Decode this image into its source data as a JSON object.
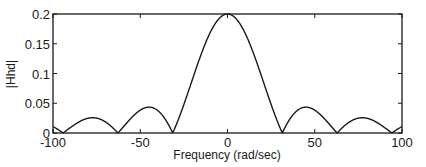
{
  "chart_data": {
    "type": "line",
    "title": "",
    "xlabel": "Frequency (rad/sec)",
    "ylabel": "|Hhd|",
    "xlim": [
      -100,
      100
    ],
    "ylim": [
      0,
      0.2
    ],
    "xticks": [
      -100,
      -50,
      0,
      50,
      100
    ],
    "xtick_labels": [
      "-100",
      "-50",
      "0",
      "50",
      "100"
    ],
    "yticks": [
      0,
      0.05,
      0.1,
      0.15,
      0.2
    ],
    "ytick_labels": [
      "0",
      "0.05",
      "0.1",
      "0.15",
      "0.2"
    ],
    "grid": false,
    "legend": null,
    "series": [
      {
        "name": "|Hhd|",
        "description": "magnitude response, approx 0.2*|sin(0.1w)/(0.1w)|",
        "x": [
          -100,
          -94.2,
          -77.3,
          -62.8,
          -45.0,
          -31.4,
          -20,
          -10,
          0,
          10,
          20,
          31.4,
          45.0,
          62.8,
          77.3,
          94.2,
          100
        ],
        "values": [
          0.011,
          0.0,
          0.026,
          0.0,
          0.043,
          0.0,
          0.091,
          0.168,
          0.2,
          0.168,
          0.091,
          0.0,
          0.043,
          0.0,
          0.026,
          0.0,
          0.011
        ]
      }
    ]
  }
}
